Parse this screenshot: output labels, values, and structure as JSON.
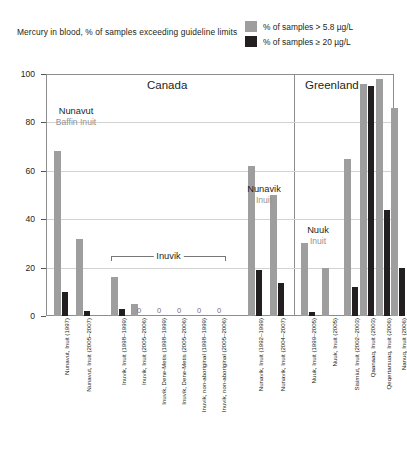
{
  "chart_data": {
    "type": "bar",
    "title": "Mercury in blood, % of samples exceeding guideline limits",
    "xlabel": "",
    "ylabel": "",
    "ylim": [
      0,
      100
    ],
    "yticks": [
      0,
      20,
      40,
      60,
      80,
      100
    ],
    "grid": true,
    "legend_position": "top-right",
    "legend": [
      {
        "name": "% of samples > 5.8 µg/L",
        "color": "#9e9e9e"
      },
      {
        "name": "% of samples ≥ 20 µg/L",
        "color": "#231f20"
      }
    ],
    "panels": [
      {
        "label": "Canada"
      },
      {
        "label": "Greenland"
      }
    ],
    "group_annotations": [
      {
        "line1": "Nunavut",
        "line2": "Baffin Inuit"
      },
      {
        "line1": "Nunavik",
        "line2": "Inuit"
      },
      {
        "line1": "Nuuk",
        "line2": "Inuit"
      }
    ],
    "bracket_label": "Inuvik",
    "categories": [
      "Nunavut, Inuit (1997)",
      "Nunavut, Inuit (2005–2007)",
      "Inuvik, Inuit (1998–1999)",
      "Inuvik, Inuit (2005–2006)",
      "Inuvik, Dene-Metis (1998–1999)",
      "Inuvik, Dene-Metis (2005–2006)",
      "Inuvik, non-aboriginal (1998–1999)",
      "Inuvik, non-aboriginal (2005–2006)",
      "Nunavik, Inuit (1992–1999)",
      "Nunavik, Inuit (2004–2007)",
      "Nuuk, Inuit (1999–2005)",
      "Nuuk, Inuit (2005)",
      "Sisimiut, Inuit (2002–2003)",
      "Qaanaaq, Inuit (2003)",
      "Qeqertarsuaq, Inuit (2006)",
      "Nanuq, Inuit (2006)"
    ],
    "series": [
      {
        "name": "% of samples > 5.8 µg/L",
        "color": "#9e9e9e",
        "values": [
          68,
          32,
          16,
          5,
          0,
          0,
          0,
          0,
          62,
          50,
          30,
          20,
          65,
          96,
          98,
          86
        ]
      },
      {
        "name": "% of samples ≥ 20 µg/L",
        "color": "#231f20",
        "values": [
          10,
          2,
          3,
          0,
          0,
          0,
          0,
          0,
          19,
          13.5,
          1.5,
          0,
          12,
          95,
          44,
          20
        ]
      }
    ],
    "zero_labels": [
      {
        "category_index": 3,
        "text": "0"
      },
      {
        "category_index": 4,
        "text": "0"
      },
      {
        "category_index": 5,
        "text": "0"
      },
      {
        "category_index": 6,
        "text": "0"
      },
      {
        "category_index": 7,
        "text": "0"
      }
    ]
  }
}
